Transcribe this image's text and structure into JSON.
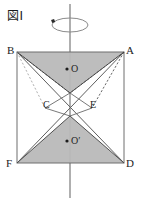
{
  "figure": {
    "caption": "図I",
    "colors": {
      "background": "#ffffff",
      "shade_fill": "#b9b9b9",
      "line": "#555555",
      "square_edge": "#6b6b6b",
      "axis": "#707070",
      "label_text": "#1d1d1d"
    },
    "axis": {
      "name": "rotation-axis",
      "x": 70,
      "y_top": 4,
      "y_bottom": 198,
      "ellipse": {
        "cx": 70,
        "cy": 25,
        "rx": 18,
        "ry": 7
      },
      "arrow_marker": {
        "x": 53,
        "y": 21
      }
    },
    "square": {
      "name": "square-BADF",
      "corners": [
        {
          "id": "B",
          "x": 17,
          "y": 52
        },
        {
          "id": "A",
          "x": 124,
          "y": 52
        },
        {
          "id": "D",
          "x": 124,
          "y": 163
        },
        {
          "id": "F",
          "x": 17,
          "y": 163
        }
      ]
    },
    "vertices": [
      {
        "label": "B",
        "name": "vertex-label-b",
        "left": 7,
        "top": 45
      },
      {
        "label": "A",
        "name": "vertex-label-a",
        "left": 126,
        "top": 45
      },
      {
        "label": "F",
        "name": "vertex-label-f",
        "left": 6,
        "top": 158
      },
      {
        "label": "D",
        "name": "vertex-label-d",
        "left": 126,
        "top": 158
      }
    ],
    "points": [
      {
        "label": "C",
        "name": "point-label-c",
        "left": 43,
        "top": 100
      },
      {
        "label": "E",
        "name": "point-label-e",
        "left": 90,
        "top": 100
      },
      {
        "label": "O",
        "name": "point-label-o",
        "left": 71,
        "top": 64,
        "dot_x": 67,
        "dot_y": 69
      },
      {
        "label": "O′",
        "name": "point-label-o-prime",
        "left": 71,
        "top": 136,
        "dot_x": 67,
        "dot_y": 141
      }
    ],
    "shaded_triangles": [
      {
        "name": "upper-shaded-triangle",
        "points": "17,52 124,52 70,93"
      },
      {
        "name": "lower-shaded-triangle",
        "points": "17,163 124,163 70,116"
      }
    ],
    "solid_lines": [
      {
        "name": "line-b-to-d",
        "x1": 17,
        "y1": 52,
        "x2": 124,
        "y2": 163
      },
      {
        "name": "line-a-to-f",
        "x1": 124,
        "y1": 52,
        "x2": 17,
        "y2": 163
      },
      {
        "name": "line-b-to-lower",
        "x1": 17,
        "y1": 52,
        "x2": 70,
        "y2": 93
      },
      {
        "name": "line-a-to-lower",
        "x1": 124,
        "y1": 52,
        "x2": 70,
        "y2": 93
      },
      {
        "name": "line-f-to-upper",
        "x1": 17,
        "y1": 163,
        "x2": 70,
        "y2": 116
      },
      {
        "name": "line-d-to-upper",
        "x1": 124,
        "y1": 163,
        "x2": 70,
        "y2": 116
      },
      {
        "name": "line-c-to-node",
        "x1": 45,
        "y1": 108,
        "x2": 70,
        "y2": 93
      },
      {
        "name": "line-e-to-node",
        "x1": 92,
        "y1": 108,
        "x2": 70,
        "y2": 116
      }
    ],
    "dashed_lines": [
      {
        "name": "dashed-b-to-c",
        "x1": 17,
        "y1": 52,
        "x2": 70,
        "y2": 93
      },
      {
        "name": "dashed-a-to-e",
        "x1": 124,
        "y1": 52,
        "x2": 92,
        "y2": 108
      },
      {
        "name": "dashed-c-seg",
        "x1": 45,
        "y1": 108,
        "x2": 70,
        "y2": 93
      },
      {
        "name": "dashed-e-seg",
        "x1": 92,
        "y1": 108,
        "x2": 70,
        "y2": 93
      }
    ]
  }
}
